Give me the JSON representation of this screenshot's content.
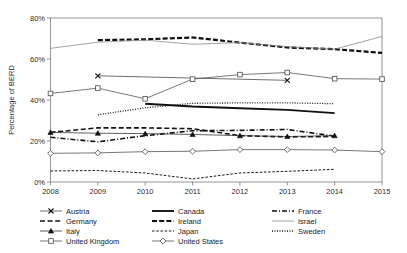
{
  "chart_data": {
    "type": "line",
    "title": "",
    "xlabel": "",
    "ylabel": "Percentage of BERD",
    "x": [
      2008,
      2009,
      2010,
      2011,
      2012,
      2013,
      2014,
      2015
    ],
    "xtick_labels": [
      "2008",
      "2009",
      "2010",
      "2011",
      "2012",
      "2013",
      "2014",
      "2015"
    ],
    "ytick_labels": [
      "0%",
      "20%",
      "40%",
      "60%",
      "80%"
    ],
    "ytick_values": [
      0,
      20,
      40,
      60,
      80
    ],
    "ylim": [
      0,
      80
    ],
    "xlim": [
      2008,
      2015
    ],
    "grid": false,
    "legend_position": "bottom",
    "series": [
      {
        "name": "Austria",
        "style": "solid-thin",
        "marker": "x",
        "color": "#3f3f3f",
        "points": [
          {
            "x": 2009,
            "y": 51.8
          },
          {
            "x": 2013,
            "y": 49.6
          }
        ]
      },
      {
        "name": "Canada",
        "style": "solid-thick",
        "marker": "none",
        "color": "#101010",
        "points": [
          {
            "x": 2010,
            "y": 38.2
          },
          {
            "x": 2011,
            "y": 36.8
          },
          {
            "x": 2012,
            "y": 36.0
          },
          {
            "x": 2013,
            "y": 35.2
          },
          {
            "x": 2014,
            "y": 33.6
          }
        ]
      },
      {
        "name": "France",
        "style": "dash-dot",
        "marker": "none",
        "color": "#111111",
        "points": [
          {
            "x": 2008,
            "y": 21.8
          },
          {
            "x": 2009,
            "y": 19.6
          },
          {
            "x": 2010,
            "y": 22.6
          },
          {
            "x": 2011,
            "y": 25.0
          },
          {
            "x": 2012,
            "y": 25.2
          },
          {
            "x": 2013,
            "y": 25.6
          },
          {
            "x": 2014,
            "y": 22.4
          }
        ]
      },
      {
        "name": "Germany",
        "style": "dashed-medium",
        "marker": "none",
        "color": "#141414",
        "points": [
          {
            "x": 2008,
            "y": 24.2
          },
          {
            "x": 2009,
            "y": 26.4
          },
          {
            "x": 2010,
            "y": 26.4
          },
          {
            "x": 2011,
            "y": 26.0
          },
          {
            "x": 2012,
            "y": 22.6
          },
          {
            "x": 2013,
            "y": 22.0
          },
          {
            "x": 2014,
            "y": 22.2
          }
        ]
      },
      {
        "name": "Ireland",
        "style": "dashed-thick",
        "marker": "none",
        "color": "#0d0d0d",
        "points": [
          {
            "x": 2009,
            "y": 69.2
          },
          {
            "x": 2010,
            "y": 69.6
          },
          {
            "x": 2011,
            "y": 70.5
          },
          {
            "x": 2012,
            "y": 68.0
          },
          {
            "x": 2013,
            "y": 65.6
          },
          {
            "x": 2014,
            "y": 64.8
          },
          {
            "x": 2015,
            "y": 63.0
          }
        ]
      },
      {
        "name": "Israel",
        "style": "solid-thin-gray",
        "marker": "none",
        "color": "#8d8d8d",
        "points": [
          {
            "x": 2008,
            "y": 65.2
          },
          {
            "x": 2009,
            "y": 68.2
          },
          {
            "x": 2010,
            "y": 69.2
          },
          {
            "x": 2011,
            "y": 67.2
          },
          {
            "x": 2012,
            "y": 68.0
          },
          {
            "x": 2013,
            "y": 66.0
          },
          {
            "x": 2014,
            "y": 64.8
          },
          {
            "x": 2015,
            "y": 71.0
          }
        ]
      },
      {
        "name": "Italy",
        "style": "solid-thin",
        "marker": "triangle",
        "color": "#2a2a2a",
        "points": [
          {
            "x": 2008,
            "y": 24.2
          },
          {
            "x": 2009,
            "y": 23.8
          },
          {
            "x": 2010,
            "y": 23.6
          },
          {
            "x": 2011,
            "y": 23.2
          },
          {
            "x": 2012,
            "y": 22.6
          },
          {
            "x": 2013,
            "y": 22.2
          },
          {
            "x": 2014,
            "y": 22.6
          }
        ]
      },
      {
        "name": "Japan",
        "style": "dashed-fine",
        "marker": "none",
        "color": "#1c1c1c",
        "points": [
          {
            "x": 2008,
            "y": 5.4
          },
          {
            "x": 2009,
            "y": 5.6
          },
          {
            "x": 2010,
            "y": 4.4
          },
          {
            "x": 2011,
            "y": 1.5
          },
          {
            "x": 2012,
            "y": 4.4
          },
          {
            "x": 2013,
            "y": 5.2
          },
          {
            "x": 2014,
            "y": 6.2
          }
        ]
      },
      {
        "name": "Sweden",
        "style": "dotted",
        "marker": "none",
        "color": "#1c1c1c",
        "points": [
          {
            "x": 2009,
            "y": 32.8
          },
          {
            "x": 2010,
            "y": 36.2
          },
          {
            "x": 2011,
            "y": 38.4
          },
          {
            "x": 2012,
            "y": 38.6
          },
          {
            "x": 2013,
            "y": 38.6
          },
          {
            "x": 2014,
            "y": 38.2
          }
        ]
      },
      {
        "name": "United Kingdom",
        "style": "solid-thin",
        "marker": "square",
        "color": "#4a4a4a",
        "points": [
          {
            "x": 2008,
            "y": 43.2
          },
          {
            "x": 2009,
            "y": 45.8
          },
          {
            "x": 2010,
            "y": 40.6
          },
          {
            "x": 2011,
            "y": 50.2
          },
          {
            "x": 2012,
            "y": 52.4
          },
          {
            "x": 2013,
            "y": 53.4
          },
          {
            "x": 2014,
            "y": 50.4
          },
          {
            "x": 2015,
            "y": 50.2
          }
        ]
      },
      {
        "name": "United States",
        "style": "solid-thin",
        "marker": "diamond",
        "color": "#4a4a4a",
        "points": [
          {
            "x": 2008,
            "y": 14.0
          },
          {
            "x": 2009,
            "y": 14.2
          },
          {
            "x": 2010,
            "y": 14.8
          },
          {
            "x": 2011,
            "y": 15.0
          },
          {
            "x": 2012,
            "y": 15.8
          },
          {
            "x": 2013,
            "y": 15.8
          },
          {
            "x": 2014,
            "y": 15.6
          },
          {
            "x": 2015,
            "y": 14.8
          }
        ]
      }
    ]
  },
  "legend": {
    "rows": [
      [
        "Austria",
        "Canada",
        "France"
      ],
      [
        "Germany",
        "Ireland",
        "Israel"
      ],
      [
        "Italy",
        "Japan",
        "Sweden"
      ],
      [
        "United Kingdom",
        "United States",
        ""
      ]
    ]
  },
  "colors": {
    "axis": "#7a7a7a",
    "text": "#1a1a1a",
    "background": "#ffffff"
  }
}
